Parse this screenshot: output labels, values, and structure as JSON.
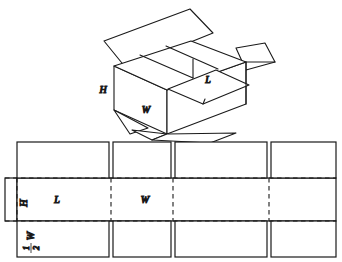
{
  "figure": {
    "stroke_color": "#1a1a1a",
    "fill_color": "#ffffff",
    "background": "#ffffff"
  },
  "box3d": {
    "labels": {
      "height": "H",
      "width": "W",
      "length": "L"
    }
  },
  "net": {
    "labels": {
      "height": "H",
      "length": "L",
      "width": "W",
      "half_width_numerator": "1",
      "half_width_denominator": "2",
      "half_width_variable": "W"
    },
    "panels": [
      {
        "name": "panel-length-1",
        "label": "L"
      },
      {
        "name": "panel-width-1",
        "label": "W"
      },
      {
        "name": "panel-length-2",
        "label": ""
      },
      {
        "name": "panel-width-2",
        "label": ""
      }
    ],
    "tab": {
      "name": "glue-tab",
      "label": ""
    }
  }
}
